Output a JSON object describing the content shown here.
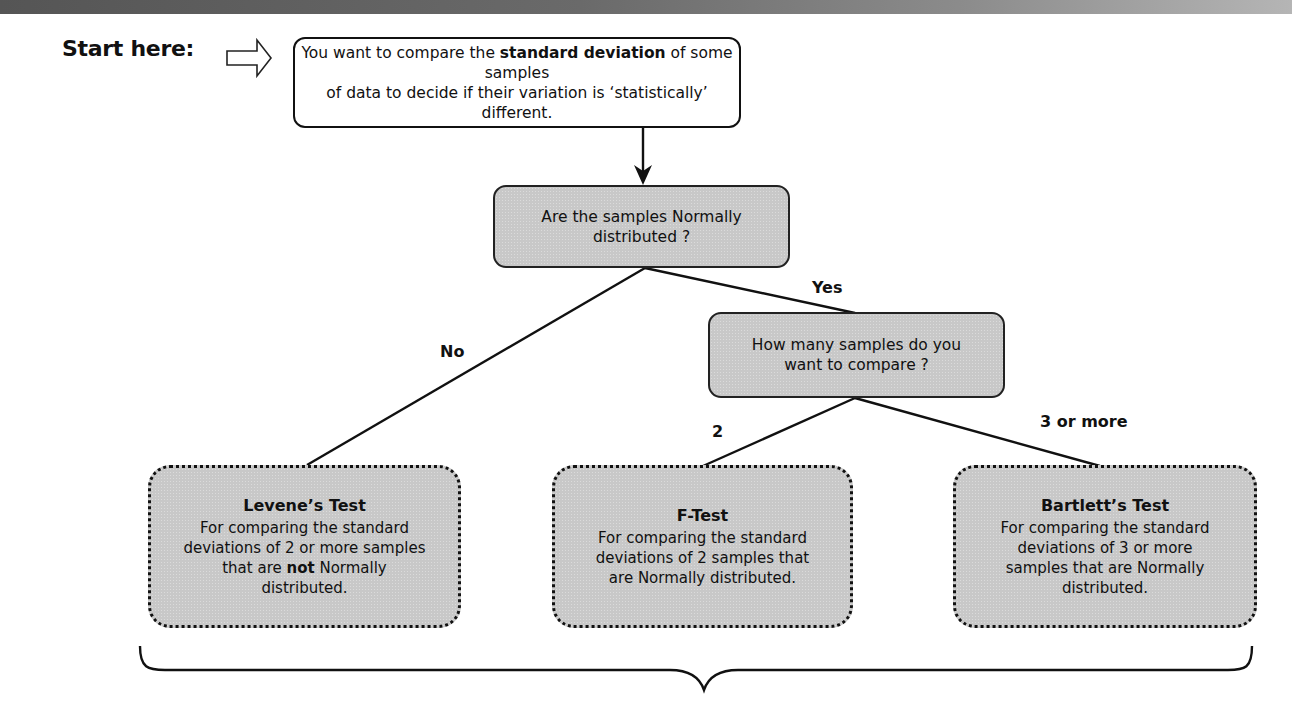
{
  "header": {
    "bar": "top-gradient-bar"
  },
  "start": {
    "label": "Start here:",
    "icon": "outline-right-arrow-icon"
  },
  "nodes": {
    "start_box": {
      "text_before": "You want to compare the ",
      "text_bold": "standard deviation",
      "text_after_line1": " of some samples",
      "line2": "of data to decide if their variation is ‘statistically’ different."
    },
    "question_normal": {
      "line1": "Are the samples Normally",
      "line2": "distributed ?"
    },
    "question_count": {
      "line1": "How many samples do you",
      "line2": "want to compare ?"
    },
    "levene": {
      "title": "Levene’s Test",
      "desc_line1": "For comparing the standard",
      "desc_line2": "deviations of 2 or more samples",
      "desc_line3_before": "that are ",
      "desc_line3_bold": "not",
      "desc_line3_after": " Normally",
      "desc_line4": "distributed."
    },
    "ftest": {
      "title": "F-Test",
      "desc_line1": "For comparing the standard",
      "desc_line2": "deviations of 2 samples that",
      "desc_line3": "are Normally distributed."
    },
    "bartlett": {
      "title": "Bartlett’s Test",
      "desc_line1": "For comparing the standard",
      "desc_line2": "deviations of 3 or more",
      "desc_line3": "samples that are Normally",
      "desc_line4": "distributed."
    }
  },
  "edges": {
    "no": "No",
    "yes": "Yes",
    "two": "2",
    "three_or_more": "3 or more"
  },
  "footer": {
    "brace": "curly-brace-grouping"
  }
}
